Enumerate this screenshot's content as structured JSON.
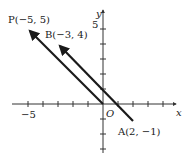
{
  "figure": {
    "axes": {
      "x_label": "x",
      "y_label": "y",
      "origin_label": "O",
      "x_tick_label": "−5",
      "y_tick_label": "5",
      "x_ticks": [
        -5,
        -4,
        -3,
        -2,
        -1,
        1,
        2,
        3,
        4
      ],
      "y_ticks": [
        -3,
        -2,
        -1,
        1,
        2,
        3,
        4,
        5
      ]
    },
    "points": {
      "P": {
        "label": "P(−5, 5)",
        "x": -5,
        "y": 5
      },
      "B": {
        "label": "B(−3, 4)",
        "x": -3,
        "y": 4
      },
      "A": {
        "label": "A(2, −1)",
        "x": 2,
        "y": -1
      },
      "O": {
        "x": 0,
        "y": 0
      }
    },
    "vectors": [
      {
        "name": "OP",
        "from": "O",
        "to": "P"
      },
      {
        "name": "AB",
        "from": "A",
        "to": "B"
      }
    ],
    "colors": {
      "ink": "#1a1a1a",
      "axis": "#333333",
      "background": "#ffffff"
    }
  }
}
